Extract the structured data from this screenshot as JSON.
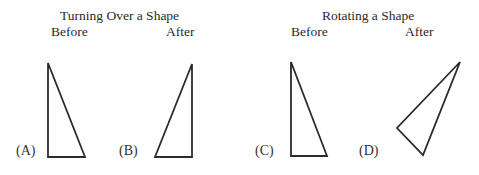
{
  "panels": [
    {
      "title": "Turning Over a Shape",
      "before_label": "Before",
      "after_label": "After",
      "figures": [
        {
          "label": "(A)",
          "stage": "Before",
          "points": [
            [
              48,
              63
            ],
            [
              48,
              157
            ],
            [
              85,
              157
            ]
          ]
        },
        {
          "label": "(B)",
          "stage": "After",
          "points": [
            [
              192,
              64
            ],
            [
              192,
              157
            ],
            [
              155,
              157
            ]
          ]
        }
      ]
    },
    {
      "title": "Rotating a Shape",
      "before_label": "Before",
      "after_label": "After",
      "figures": [
        {
          "label": "(C)",
          "stage": "Before",
          "points": [
            [
              291,
              62
            ],
            [
              291,
              156
            ],
            [
              327,
              156
            ]
          ]
        },
        {
          "label": "(D)",
          "stage": "After",
          "points": [
            [
              460,
              62
            ],
            [
              397,
              128
            ],
            [
              423,
              155
            ]
          ]
        }
      ]
    }
  ],
  "style": {
    "stroke_color": "#2b2b2b",
    "text_color": "#2a2a2a",
    "background": "#ffffff"
  }
}
